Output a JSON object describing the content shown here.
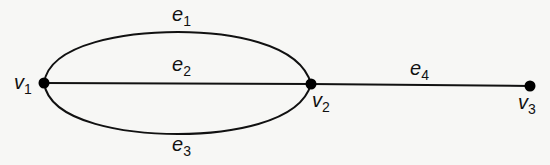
{
  "diagram": {
    "type": "graph",
    "colors": {
      "background": "#f7f7f5",
      "stroke": "#111111",
      "vertex": "#000000"
    },
    "vertices": [
      {
        "id": "v1",
        "name": "v",
        "sub": "1",
        "x": 44,
        "y": 83
      },
      {
        "id": "v2",
        "name": "v",
        "sub": "2",
        "x": 311,
        "y": 84
      },
      {
        "id": "v3",
        "name": "v",
        "sub": "3",
        "x": 530,
        "y": 86
      }
    ],
    "edges": [
      {
        "id": "e1",
        "name": "e",
        "sub": "1",
        "from": "v1",
        "to": "v2",
        "shape": "upper-arc"
      },
      {
        "id": "e2",
        "name": "e",
        "sub": "2",
        "from": "v1",
        "to": "v2",
        "shape": "straight"
      },
      {
        "id": "e3",
        "name": "e",
        "sub": "3",
        "from": "v1",
        "to": "v2",
        "shape": "lower-arc"
      },
      {
        "id": "e4",
        "name": "e",
        "sub": "4",
        "from": "v2",
        "to": "v3",
        "shape": "straight"
      }
    ]
  }
}
